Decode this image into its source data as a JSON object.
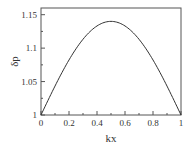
{
  "chart_data": {
    "type": "line",
    "title": "",
    "xlabel": "kx",
    "ylabel": "δp",
    "xlim": [
      0,
      1
    ],
    "ylim": [
      1,
      1.16
    ],
    "x_ticks": [
      "0",
      "0.2",
      "0.4",
      "0.6",
      "0.8",
      "1"
    ],
    "y_ticks": [
      "1",
      "1.05",
      "1.1",
      "1.15"
    ],
    "grid": false,
    "series": [
      {
        "name": "δp",
        "x": [
          0,
          0.1,
          0.2,
          0.3,
          0.4,
          0.5,
          0.6,
          0.7,
          0.8,
          0.9,
          1.0
        ],
        "values": [
          1.0,
          1.043,
          1.082,
          1.113,
          1.133,
          1.14,
          1.133,
          1.113,
          1.082,
          1.043,
          1.0
        ]
      }
    ]
  }
}
